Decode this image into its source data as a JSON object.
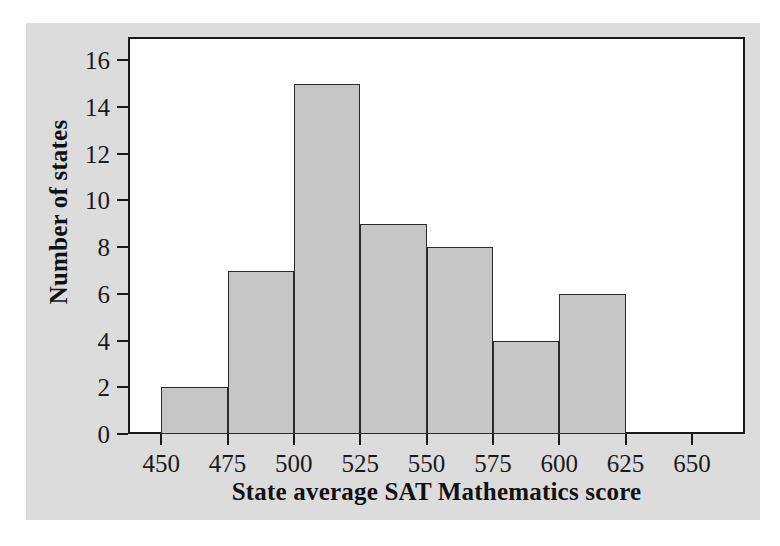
{
  "chart_data": {
    "type": "bar",
    "title": "",
    "subtitle": "",
    "xlabel": "State average SAT Mathematics score",
    "ylabel": "Number of states",
    "categories": [
      "450-475",
      "475-500",
      "500-525",
      "525-550",
      "550-575",
      "575-600",
      "600-625"
    ],
    "bin_starts": [
      450,
      475,
      500,
      525,
      550,
      575,
      600
    ],
    "bin_width": 25,
    "values": [
      2,
      7,
      15,
      9,
      8,
      4,
      6
    ],
    "xlim": [
      437.5,
      670
    ],
    "ylim": [
      0,
      17
    ],
    "xticks": [
      450,
      475,
      500,
      525,
      550,
      575,
      600,
      625,
      650
    ],
    "xtick_labels": [
      "450",
      "475",
      "500",
      "525",
      "550",
      "575",
      "600",
      "625",
      "650"
    ],
    "yticks": [
      0,
      2,
      4,
      6,
      8,
      10,
      12,
      14,
      16
    ],
    "ytick_labels": [
      "0",
      "2",
      "4",
      "6",
      "8",
      "10",
      "12",
      "14",
      "16"
    ],
    "grid": false,
    "legend": false,
    "bar_fill_color": "#c6c6c6",
    "bar_edge_color": "#2b2b2b",
    "panel_color": "#dcdcdc",
    "plot_background": "#ffffff",
    "axis_color": "#1a1a1a"
  }
}
